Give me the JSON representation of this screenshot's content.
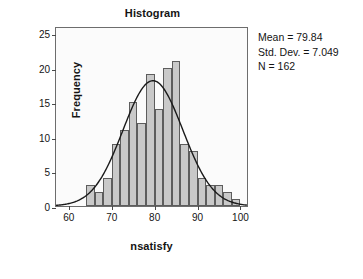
{
  "chart_data": {
    "type": "bar",
    "title": "Histogram",
    "xlabel": "nsatisfy",
    "ylabel": "Frequency",
    "grid": false,
    "legend_position": "none",
    "xlim": [
      57,
      102
    ],
    "ylim": [
      0,
      26
    ],
    "bin_width": 2,
    "x_ticks": [
      60,
      70,
      80,
      90,
      100
    ],
    "y_ticks": [
      0,
      5,
      10,
      15,
      20,
      25
    ],
    "bin_starts": [
      62,
      64,
      66,
      68,
      70,
      72,
      74,
      76,
      78,
      80,
      82,
      84,
      86,
      88,
      90,
      92,
      94,
      96,
      98
    ],
    "bin_centers": [
      63,
      65,
      67,
      69,
      71,
      73,
      75,
      77,
      79,
      81,
      83,
      85,
      87,
      89,
      91,
      93,
      95,
      97,
      99
    ],
    "values": [
      0,
      3,
      2,
      4,
      9,
      11,
      15,
      12,
      19,
      14,
      20,
      21,
      9,
      8,
      4,
      3,
      3,
      2,
      1
    ],
    "overlay": {
      "type": "normal-curve",
      "mean": 79.84,
      "std_dev": 7.049,
      "n": 162,
      "peak_value": 18.3,
      "color": "#1a1a1a"
    },
    "bar_fill": "#c9c9c9",
    "bar_stroke": "#5d5d5d",
    "frame_color": "#6d6d6d",
    "plot_background": "#fbfbfb"
  },
  "annotations": {
    "mean": "Mean = 79.84",
    "std_dev": "Std. Dev. = 7.049",
    "n": "N = 162"
  }
}
